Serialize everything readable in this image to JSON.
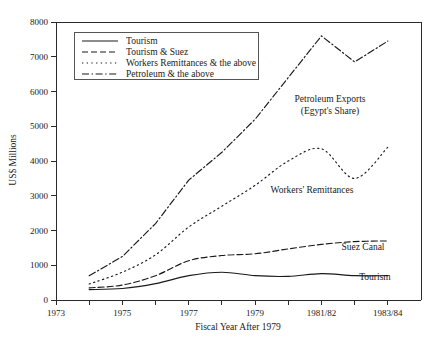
{
  "chart_data": {
    "type": "line",
    "title": "",
    "xlabel": "Fiscal Year After 1979",
    "ylabel": "US$ Millions",
    "ylim": [
      0,
      8000
    ],
    "xlim": [
      1973,
      1984
    ],
    "grid": false,
    "legend_position": "top-left",
    "y_ticks": [
      "0",
      "1000",
      "2000",
      "3000",
      "4000",
      "5000",
      "6000",
      "7000",
      "8000"
    ],
    "y_tick_values": [
      0,
      1000,
      2000,
      3000,
      4000,
      5000,
      6000,
      7000,
      8000
    ],
    "x_ticks": [
      "1973",
      "",
      "1975",
      "",
      "1977",
      "",
      "1979",
      "",
      "1981/82",
      "",
      "1983/84"
    ],
    "x_tick_values": [
      1973,
      1974,
      1975,
      1976,
      1977,
      1978,
      1979,
      1980,
      1981,
      1982,
      1983
    ],
    "x": [
      1974,
      1975,
      1976,
      1977,
      1978,
      1979,
      1980,
      1981,
      1982,
      1983
    ],
    "series": [
      {
        "name": "Tourism",
        "dash": "none",
        "values": [
          300,
          330,
          470,
          700,
          800,
          700,
          680,
          760,
          700,
          700
        ]
      },
      {
        "name": "Tourism & Suez",
        "dash": "dashed",
        "values": [
          350,
          430,
          700,
          1130,
          1280,
          1330,
          1470,
          1600,
          1680,
          1700
        ]
      },
      {
        "name": "Workers Remittances & the above",
        "dash": "dotted",
        "values": [
          460,
          800,
          1300,
          2100,
          2700,
          3300,
          4000,
          4350,
          3500,
          4400
        ]
      },
      {
        "name": "Petroleum & the above",
        "dash": "dashdot",
        "values": [
          700,
          1250,
          2200,
          3450,
          4250,
          5200,
          6400,
          7600,
          6850,
          7450
        ]
      }
    ],
    "annotations": [
      {
        "text": "Petroleum Exports",
        "x": 330,
        "y": 102
      },
      {
        "text": "(Egypt's Share)",
        "x": 330,
        "y": 114
      },
      {
        "text": "Workers' Remittances",
        "x": 312,
        "y": 193
      },
      {
        "text": "Suez Canal",
        "x": 363,
        "y": 250
      },
      {
        "text": "Tourism",
        "x": 375,
        "y": 280
      }
    ]
  },
  "legend": {
    "items": [
      {
        "label": "Tourism"
      },
      {
        "label": "Tourism & Suez"
      },
      {
        "label": "Workers Remittances & the above"
      },
      {
        "label": "Petroleum & the above"
      }
    ]
  },
  "colors": {
    "ink": "#1a1a1a",
    "axis": "#2a2a2a",
    "background": "#ffffff",
    "legend_border": "#555555"
  }
}
